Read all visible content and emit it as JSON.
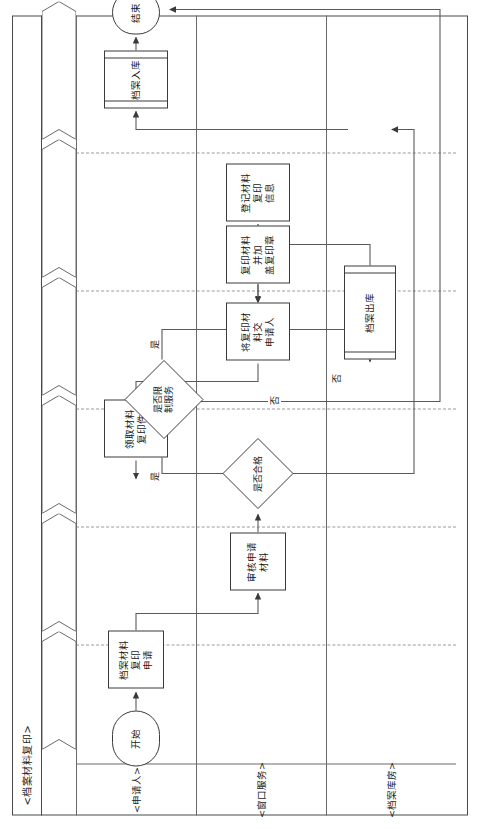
{
  "diagram": {
    "title": "<档案材料复印>",
    "type": "cross-functional-flowchart",
    "orientation": "rotated-90-ccw",
    "phases": [
      {
        "label": "<材料复印申请>"
      },
      {
        "label": "<审核申请>"
      },
      {
        "label": "<限制服务检查>"
      },
      {
        "label": "<档案出库>"
      },
      {
        "label": "<材料复印>"
      },
      {
        "label": "<档案入库>"
      }
    ],
    "lanes": [
      {
        "label": "<申请人>"
      },
      {
        "label": "<窗口服务>"
      },
      {
        "label": "<档案库房>"
      }
    ],
    "nodes": [
      {
        "id": "start",
        "label": "开始",
        "shape": "terminator"
      },
      {
        "id": "apply",
        "label": "档案材料复印\n申请",
        "shape": "process"
      },
      {
        "id": "review",
        "label": "审核申请材料",
        "shape": "process"
      },
      {
        "id": "qualified",
        "label": "是否合格",
        "shape": "decision"
      },
      {
        "id": "restrict",
        "label": "是否限\n制服务",
        "shape": "decision"
      },
      {
        "id": "checkout",
        "label": "档案出库",
        "shape": "predefined"
      },
      {
        "id": "register",
        "label": "登记材料复印\n信息",
        "shape": "process"
      },
      {
        "id": "copystamp",
        "label": "复印材料并加\n盖复印章",
        "shape": "process"
      },
      {
        "id": "handover",
        "label": "将复印材料交\n申请人",
        "shape": "process"
      },
      {
        "id": "receive",
        "label": "领取材料\n复印件",
        "shape": "process"
      },
      {
        "id": "checkin",
        "label": "档案入库",
        "shape": "predefined"
      },
      {
        "id": "end",
        "label": "结束",
        "shape": "terminator"
      }
    ],
    "edge_labels": {
      "qualified_no": "否",
      "restrict_yes_down": "是",
      "restrict_yes_right": "是",
      "checkout_no": "否"
    },
    "colors": {
      "stroke": "#3a3a3a",
      "frame": "#4a4a4a",
      "divider": "#9a9a9a",
      "background": "#ffffff",
      "text": "#1a1a1a"
    }
  }
}
